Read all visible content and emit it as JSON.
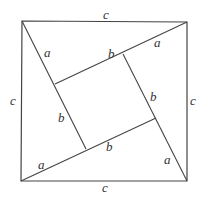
{
  "diagram": {
    "title": "",
    "stroke_color": "#444444",
    "outer_square": {
      "points": [
        [
          22,
          21
        ],
        [
          187,
          22
        ],
        [
          187,
          181
        ],
        [
          21,
          181
        ]
      ]
    },
    "diagonals": [
      {
        "name": "top-left-to-inner",
        "from": [
          22,
          21
        ],
        "to": [
          86,
          149
        ]
      },
      {
        "name": "top-right-to-inner",
        "from": [
          187,
          22
        ],
        "to": [
          55,
          84
        ]
      },
      {
        "name": "bottom-right-to-inner",
        "from": [
          187,
          181
        ],
        "to": [
          123,
          54
        ]
      },
      {
        "name": "bottom-left-to-inner",
        "from": [
          21,
          181
        ],
        "to": [
          156,
          118
        ]
      }
    ],
    "inner_square": {
      "points": [
        [
          55,
          84
        ],
        [
          123,
          54
        ],
        [
          156,
          118
        ],
        [
          86,
          149
        ]
      ]
    },
    "labels": [
      {
        "id": "c-top",
        "text": "c",
        "x": 103,
        "y": 19
      },
      {
        "id": "a-top-left",
        "text": "a",
        "x": 44,
        "y": 57
      },
      {
        "id": "b-inner-top",
        "text": "b",
        "x": 108,
        "y": 58
      },
      {
        "id": "a-top-right",
        "text": "a",
        "x": 154,
        "y": 47
      },
      {
        "id": "c-left",
        "text": "c",
        "x": 10,
        "y": 105
      },
      {
        "id": "b-inner-right",
        "text": "b",
        "x": 150,
        "y": 101
      },
      {
        "id": "c-right",
        "text": "c",
        "x": 190,
        "y": 105
      },
      {
        "id": "b-inner-left",
        "text": "b",
        "x": 58,
        "y": 122
      },
      {
        "id": "b-inner-bottom",
        "text": "b",
        "x": 106,
        "y": 151
      },
      {
        "id": "a-bottom-left",
        "text": "a",
        "x": 38,
        "y": 169
      },
      {
        "id": "a-bottom-right",
        "text": "a",
        "x": 164,
        "y": 164
      },
      {
        "id": "c-bottom",
        "text": "c",
        "x": 102,
        "y": 192
      }
    ]
  }
}
